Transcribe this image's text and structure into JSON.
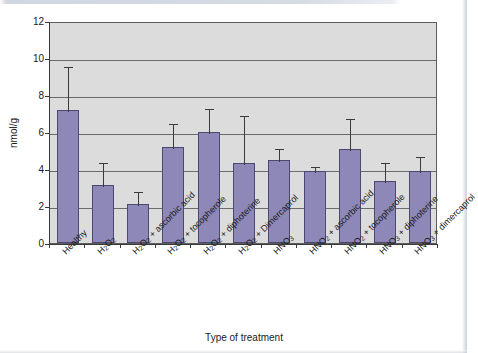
{
  "chart_data": {
    "type": "bar",
    "title": "",
    "xlabel": "Type of treatment",
    "ylabel": "nmol/g",
    "ylim": [
      0,
      12
    ],
    "ytick_step": 2,
    "yticks": [
      "0",
      "2",
      "4",
      "6",
      "8",
      "10",
      "12"
    ],
    "grid": true,
    "legend": "none",
    "bar_color": "#8d88b8",
    "bar_border_color": "#4c4870",
    "plot_background": "#dcdcdc",
    "error_bar_style": "upper-whisker-with-cap",
    "categories": [
      "Healthy",
      "H2O2",
      "H2O2 + ascorbic acid",
      "H2O2 + tocopherole",
      "H2O2 + diphoterine",
      "H2O2 + Dimercaprol",
      "HNO3",
      "HNO2 + ascorbic acid",
      "HNO2 + tocopherole",
      "HNO3 + diphoterine",
      "HNO3 + dimercaprol"
    ],
    "values": [
      7.2,
      3.15,
      2.1,
      5.2,
      6.0,
      4.3,
      4.5,
      3.9,
      5.1,
      3.35,
      3.9
    ],
    "error_upper": [
      2.4,
      1.3,
      0.75,
      1.35,
      1.35,
      2.65,
      0.7,
      0.3,
      1.7,
      1.1,
      0.85
    ]
  },
  "axis_labels": [
    {
      "html": "Healthy"
    },
    {
      "html": "H<sub>2</sub>O<sub>2</sub>"
    },
    {
      "html": "H<sub>2</sub>O<sub>2</sub> + ascorbic acid"
    },
    {
      "html": "H<sub>2</sub>O<sub>2</sub> + tocopherole"
    },
    {
      "html": "H<sub>2</sub>O<sub>2</sub> + diphoterine"
    },
    {
      "html": "H<sub>2</sub>O<sub>2</sub> + Dimercaprol"
    },
    {
      "html": "HNO<sub>3</sub>"
    },
    {
      "html": "HNO<sub>2</sub> + ascorbic acid"
    },
    {
      "html": "HNO<sub>2</sub> + tocopherole"
    },
    {
      "html": "HNO<sub>3</sub> + diphoterine"
    },
    {
      "html": "HNO<sub>3</sub> + dimercaprol"
    }
  ]
}
